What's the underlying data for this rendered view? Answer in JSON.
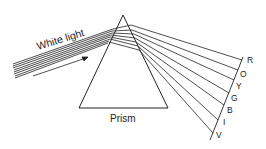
{
  "labels": {
    "incident": "White light",
    "prism": "Prism"
  },
  "spectrum": [
    "R",
    "O",
    "Y",
    "G",
    "B",
    "I",
    "V"
  ],
  "colors": {
    "ink": "#222222",
    "background": "#ffffff"
  }
}
